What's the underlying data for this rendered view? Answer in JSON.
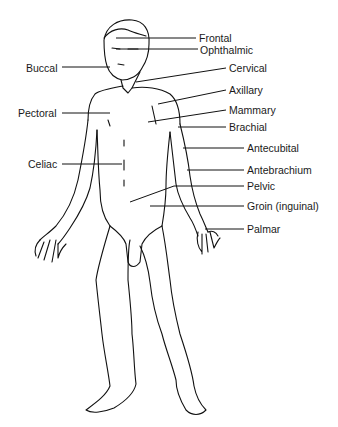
{
  "diagram": {
    "labels": {
      "frontal": "Frontal",
      "ophthalmic": "Ophthalmic",
      "buccal": "Buccal",
      "cervical": "Cervical",
      "axillary": "Axillary",
      "pectoral": "Pectoral",
      "mammary": "Mammary",
      "brachial": "Brachial",
      "antecubital": "Antecubital",
      "celiac": "Celiac",
      "antebrachium": "Antebrachium",
      "pelvic": "Pelvic",
      "groin": "Groin (inguinal)",
      "palmar": "Palmar"
    }
  }
}
